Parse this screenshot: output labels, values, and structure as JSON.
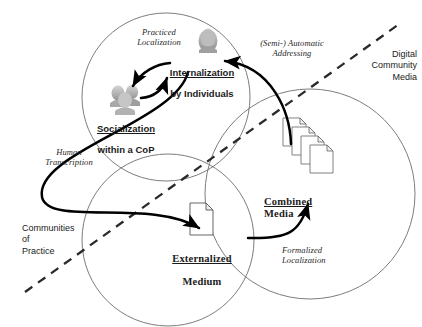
{
  "figure": {
    "type": "concept-diagram",
    "background_color": "#ffffff",
    "line_color": "#555555",
    "arrow_color": "#000000",
    "text_color": "#1b1b1b"
  },
  "regions": [
    {
      "id": "communities-of-practice",
      "label": "Communities\nof\nPractice",
      "side": "lower-left",
      "align": "left"
    },
    {
      "id": "digital-community-media",
      "label": "Digital\nCommunity\nMedia",
      "side": "upper-right",
      "align": "right"
    }
  ],
  "divider": {
    "id": "dashed-diagonal-divider",
    "style": "dashed",
    "from": [
      25,
      292
    ],
    "to": [
      402,
      22
    ]
  },
  "circles": [
    {
      "id": "circle-socialization",
      "cx": 166,
      "cy": 97,
      "r": 84
    },
    {
      "id": "circle-externalization",
      "cx": 168,
      "cy": 240,
      "r": 86
    },
    {
      "id": "circle-digital-media",
      "cx": 310,
      "cy": 194,
      "r": 105
    }
  ],
  "nodes": [
    {
      "id": "internalization",
      "line1": "Internalization",
      "line2": "by Individuals",
      "underline_line1": true,
      "icon": "person-icon"
    },
    {
      "id": "socialization",
      "line1": "Socialization",
      "line2": "within a CoP",
      "underline_line1": true,
      "icon": "people-group-icon"
    },
    {
      "id": "externalized-medium",
      "line1": "Externalized",
      "line2": "Medium",
      "underline_line1": true,
      "icon": "document-icon"
    },
    {
      "id": "combined-media",
      "line1": "Combined",
      "line2": "Media",
      "underline_line1": true,
      "icon": "document-stack-icon"
    }
  ],
  "processes": [
    {
      "id": "practiced-localization",
      "label": "Practiced\nLocalization"
    },
    {
      "id": "semi-automatic-addressing",
      "label": "(Semi-) Automatic\nAddressing"
    },
    {
      "id": "human-transcription",
      "label": "Human\nTranscription"
    },
    {
      "id": "formalized-localization",
      "label": "Formalized\nLocalization"
    }
  ]
}
